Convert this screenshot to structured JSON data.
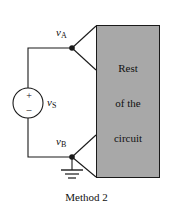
{
  "figure": {
    "caption": "Method 2",
    "type": "circuit-diagram"
  },
  "colors": {
    "block_fill": "#a8a8a8",
    "line": "#1a1a1a",
    "text": "#111111",
    "background": "#ffffff"
  },
  "source": {
    "symbol": "independent-voltage-source",
    "label_v": "v",
    "label_sub": "S",
    "plus_sign": "+",
    "minus_sign": "–"
  },
  "nodes": [
    {
      "id": "a",
      "label_v": "v",
      "label_sub": "A"
    },
    {
      "id": "b",
      "label_v": "v",
      "label_sub": "B"
    }
  ],
  "block": {
    "lines": [
      "Rest",
      "of the",
      "circuit"
    ]
  },
  "ground": {
    "symbol": "earth-ground"
  }
}
